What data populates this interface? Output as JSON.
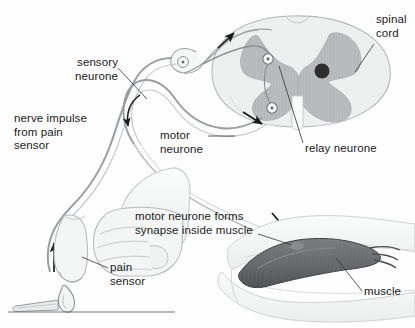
{
  "figure": {
    "background_color": "#fefefe",
    "line_color": "#6f7274",
    "text_color": "#1a1a1a"
  },
  "labels": {
    "sensory_neurone": "sensory\nneurone",
    "nerve_impulse": "nerve impulse\nfrom pain\nsensor",
    "motor_neurone": "motor\nneurone",
    "spinal_cord": "spinal\ncord",
    "relay_neurone": "relay neurone",
    "pain_sensor": "pain\nsensor",
    "synapse_note": "motor neurone forms\nsynapse inside muscle",
    "muscle": "muscle"
  },
  "colors": {
    "grey_matter": "#b9bcbe",
    "white_matter": "#eef0f0",
    "muscle_fill": "#6e7274",
    "muscle_dark": "#55595b",
    "arm_fill": "#f2f3f3",
    "hand_fill": "#f4f5f5",
    "outline": "#8b8f91",
    "central_canal": "#2e2e2e",
    "arrow": "#1a1a1a",
    "leader": "#333333",
    "rule": "#666666"
  },
  "structures": [
    {
      "name": "spinal-cord-cross-section",
      "description": "oval cross-section with butterfly-shaped grey matter and central canal"
    },
    {
      "name": "dorsal-root-ganglion",
      "description": "bulge on sensory neurone with cell body"
    },
    {
      "name": "sensory-neurone-fibre",
      "description": "long fibre from fingertip to spinal cord dorsal horn"
    },
    {
      "name": "motor-neurone-fibre",
      "description": "fibre from ventral horn of spinal cord to muscle"
    },
    {
      "name": "relay-neurone-synapses",
      "description": "two synapse nodes inside grey matter"
    },
    {
      "name": "hand-fist",
      "description": "clenched fist with index finger extended toward flame"
    },
    {
      "name": "candle-flame",
      "description": "lit match/candle under fingertip"
    },
    {
      "name": "arm-with-muscle",
      "description": "forearm with striated biceps muscle"
    }
  ],
  "arrows": [
    {
      "name": "impulse-up-finger",
      "direction": "up",
      "meaning": "impulse travels up from pain sensor"
    },
    {
      "name": "impulse-toward-cord",
      "direction": "up-right",
      "meaning": "impulse enters spinal cord"
    },
    {
      "name": "impulse-down-motor",
      "direction": "down",
      "meaning": "impulse leaves along motor neurone"
    },
    {
      "name": "impulse-into-cord-ventral",
      "direction": "down-right",
      "meaning": "motor output from ventral horn"
    },
    {
      "name": "synapse-pointer",
      "direction": "down-right",
      "meaning": "points to synapse inside muscle"
    }
  ],
  "footer_rule": {
    "name": "bottom-rule",
    "visible": true
  }
}
